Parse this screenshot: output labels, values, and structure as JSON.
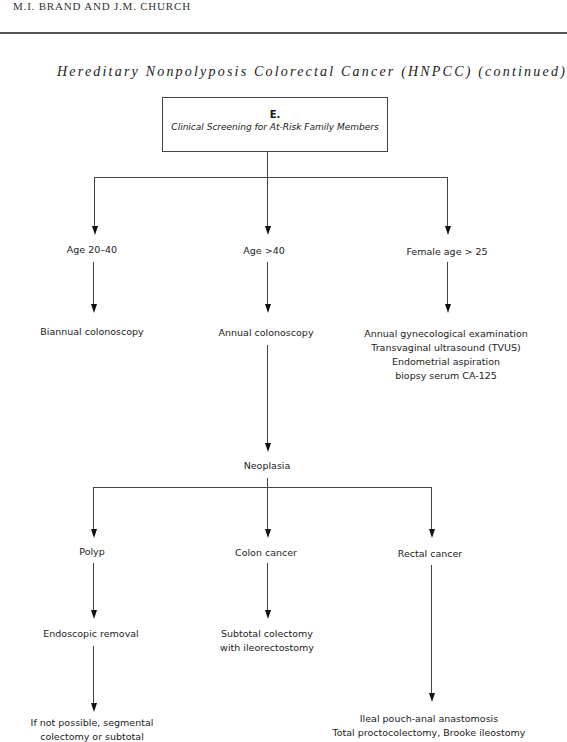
{
  "header": {
    "running_head": "M.I. BRAND AND J.M. CHURCH",
    "title": "Hereditary Nonpolyposis Colorectal Cancer (HNPCC) (continued)"
  },
  "root_box": {
    "letter": "E.",
    "subtitle": "Clinical Screening for At-Risk Family Members"
  },
  "level1": [
    {
      "label": "Age 20–40",
      "action": "Biannual colonoscopy"
    },
    {
      "label": "Age >40",
      "action": "Annual colonoscopy"
    },
    {
      "label": "Female age > 25",
      "action_lines": [
        "Annual gynecological examination",
        "Transvaginal ultrasound (TVUS)",
        "Endometrial aspiration",
        "biopsy serum CA-125"
      ]
    }
  ],
  "neoplasia": {
    "label": "Neoplasia",
    "branches": [
      {
        "label": "Polyp",
        "step": "Endoscopic removal",
        "fallback_lines": [
          "If not possible, segmental",
          "colectomy or subtotal"
        ]
      },
      {
        "label": "Colon cancer",
        "treatment_lines": [
          "Subtotal colectomy",
          "with ileorectostomy"
        ]
      },
      {
        "label": "Rectal cancer",
        "treatment_lines": [
          "Ileal pouch-anal anastomosis",
          "Total proctocolectomy, Brooke ileostomy"
        ]
      }
    ]
  }
}
